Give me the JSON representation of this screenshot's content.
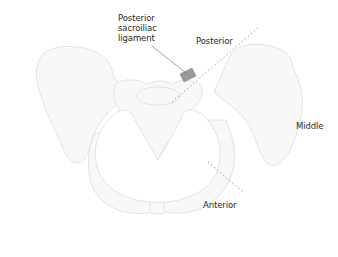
{
  "diagram": {
    "labels": {
      "ligament": [
        "Posterior",
        "sacroiliac",
        "ligament"
      ],
      "posterior": "Posterior",
      "middle": "Middle",
      "anterior": "Anterior"
    },
    "colors": {
      "bone_outline": "#d9d9d9",
      "bone_fill": "#f7f7f7",
      "ligament_fill": "#9a9a9a",
      "dotted_line": "#9a9a9a",
      "leader_line": "#6a6a6a",
      "text": "#2a2a2a"
    }
  }
}
